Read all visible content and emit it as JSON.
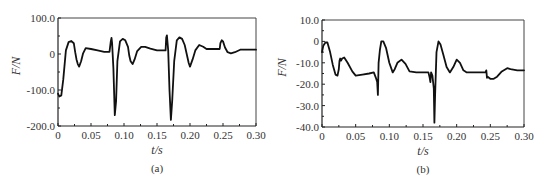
{
  "chart_data": [
    {
      "id": "a",
      "type": "line",
      "title": "",
      "caption": "(a)",
      "xlabel": "t/s",
      "ylabel": "F/N",
      "xlim": [
        0,
        0.3
      ],
      "ylim": [
        -200,
        100
      ],
      "xticks": [
        0,
        0.05,
        0.1,
        0.15,
        0.2,
        0.25,
        0.3
      ],
      "xtick_labels": [
        "0",
        "0.05",
        "0.10",
        "0.15",
        "0.20",
        "0.25",
        "0.30"
      ],
      "yticks": [
        100,
        0,
        -100,
        -200
      ],
      "ytick_labels": [
        "100.0",
        "0",
        "-100.0",
        "-200.0"
      ],
      "grid": false,
      "series": [
        {
          "name": "F",
          "x": [
            0,
            0.002,
            0.005,
            0.008,
            0.012,
            0.016,
            0.02,
            0.024,
            0.026,
            0.028,
            0.03,
            0.032,
            0.035,
            0.038,
            0.042,
            0.05,
            0.06,
            0.07,
            0.078,
            0.08,
            0.081,
            0.082,
            0.084,
            0.086,
            0.088,
            0.09,
            0.094,
            0.098,
            0.102,
            0.106,
            0.108,
            0.11,
            0.113,
            0.116,
            0.12,
            0.126,
            0.132,
            0.14,
            0.15,
            0.16,
            0.163,
            0.164,
            0.165,
            0.167,
            0.169,
            0.171,
            0.173,
            0.176,
            0.18,
            0.184,
            0.188,
            0.192,
            0.195,
            0.198,
            0.2,
            0.204,
            0.208,
            0.214,
            0.22,
            0.225,
            0.235,
            0.245,
            0.246,
            0.248,
            0.25,
            0.253,
            0.257,
            0.262,
            0.268,
            0.276,
            0.285,
            0.3
          ],
          "y": [
            -110,
            -118,
            -115,
            -70,
            10,
            33,
            36,
            30,
            5,
            -15,
            -28,
            -35,
            -20,
            2,
            16,
            14,
            10,
            6,
            6,
            35,
            45,
            30,
            -40,
            -170,
            -130,
            -20,
            35,
            42,
            38,
            20,
            -5,
            -20,
            -28,
            -15,
            8,
            20,
            20,
            15,
            10,
            10,
            10,
            45,
            52,
            10,
            -100,
            -183,
            -130,
            -20,
            38,
            46,
            42,
            25,
            0,
            -25,
            -35,
            -15,
            10,
            25,
            20,
            14,
            14,
            14,
            30,
            38,
            35,
            18,
            5,
            2,
            5,
            12,
            12,
            12
          ]
        }
      ]
    },
    {
      "id": "b",
      "type": "line",
      "title": "",
      "caption": "(b)",
      "xlabel": "t/s",
      "ylabel": "F/N",
      "xlim": [
        0,
        0.3
      ],
      "ylim": [
        -40,
        10
      ],
      "xticks": [
        0,
        0.05,
        0.1,
        0.15,
        0.2,
        0.25,
        0.3
      ],
      "xtick_labels": [
        "0",
        "0.05",
        "0.10",
        "0.15",
        "0.20",
        "0.25",
        "0.30"
      ],
      "yticks": [
        10,
        0,
        -10,
        -20,
        -30,
        -40
      ],
      "ytick_labels": [
        "10.0",
        "0",
        "-10.0",
        "-20.0",
        "-30.0",
        "-40.0"
      ],
      "grid": false,
      "series": [
        {
          "name": "F",
          "x": [
            0,
            0.002,
            0.005,
            0.008,
            0.012,
            0.016,
            0.02,
            0.023,
            0.025,
            0.026,
            0.027,
            0.028,
            0.03,
            0.033,
            0.038,
            0.045,
            0.05,
            0.06,
            0.07,
            0.077,
            0.08,
            0.082,
            0.083,
            0.084,
            0.086,
            0.088,
            0.091,
            0.095,
            0.1,
            0.105,
            0.108,
            0.112,
            0.118,
            0.124,
            0.13,
            0.14,
            0.15,
            0.158,
            0.16,
            0.161,
            0.162,
            0.164,
            0.166,
            0.167,
            0.168,
            0.17,
            0.173,
            0.176,
            0.18,
            0.185,
            0.19,
            0.195,
            0.2,
            0.205,
            0.21,
            0.215,
            0.22,
            0.23,
            0.243,
            0.244,
            0.245,
            0.246,
            0.25,
            0.255,
            0.26,
            0.267,
            0.275,
            0.28,
            0.29,
            0.3
          ],
          "y": [
            -5,
            -2,
            -0.5,
            -0.5,
            -5,
            -11,
            -15.5,
            -16,
            -13,
            -9,
            -8,
            -9,
            -8,
            -7.5,
            -10,
            -14,
            -16,
            -15.5,
            -15,
            -14.5,
            -17,
            -19,
            -25,
            -10,
            -4,
            0,
            0,
            -3,
            -10,
            -14.5,
            -13,
            -10,
            -8.5,
            -10.5,
            -14,
            -14.5,
            -14.5,
            -14.5,
            -17,
            -19,
            -14.5,
            -16,
            -22,
            -38,
            -25,
            -5,
            0,
            -1.5,
            -6,
            -12,
            -14.5,
            -12,
            -8.5,
            -10,
            -13.5,
            -14.5,
            -14.5,
            -14.5,
            -14.5,
            -13.5,
            -17,
            -16.5,
            -17.5,
            -17.5,
            -16.5,
            -14,
            -12.5,
            -13,
            -13.5,
            -13.5
          ]
        }
      ]
    }
  ]
}
